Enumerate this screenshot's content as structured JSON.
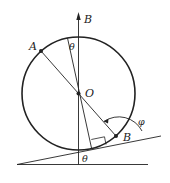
{
  "diagram": {
    "type": "geometry-physics",
    "labels": {
      "vertical_axis": "B",
      "point_top_left": "A",
      "center": "O",
      "contact_region_point": "B",
      "angle_top": "θ",
      "angle_bottom": "θ",
      "angle_phi": "φ"
    },
    "colors": {
      "stroke": "#222222",
      "background": "#ffffff"
    }
  }
}
